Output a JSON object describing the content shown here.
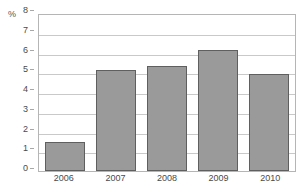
{
  "chart_data": {
    "type": "bar",
    "title": "",
    "subtitle": "",
    "xlabel": "",
    "ylabel": "%",
    "unit_label": "%",
    "categories": [
      "2006",
      "2007",
      "2008",
      "2009",
      "2010"
    ],
    "values": [
      1.5,
      5.2,
      5.4,
      6.2,
      5.0
    ],
    "series": [
      {
        "name": "",
        "values": [
          1.5,
          5.2,
          5.4,
          6.2,
          5.0
        ]
      }
    ],
    "ylim": [
      0,
      8
    ],
    "y_ticks": [
      0,
      1,
      2,
      3,
      4,
      5,
      6,
      7,
      8
    ],
    "y_tick_labels": [
      "0",
      "1",
      "2",
      "3",
      "4",
      "5",
      "6",
      "7",
      "8"
    ],
    "grid": true,
    "grid_axis": "y",
    "legend": false,
    "legend_position": "none",
    "annotations": []
  },
  "style": {
    "bar_fill": "#9a9a9a",
    "bar_stroke": "#5f5f5f",
    "grid_color": "#c9c9c9",
    "frame_color": "#b5b5b5",
    "text_color": "#4a4a4a",
    "background": "#ffffff"
  }
}
